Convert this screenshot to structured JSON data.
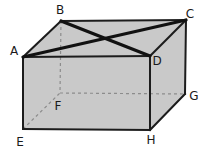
{
  "diagram": {
    "type": "cuboid-wireframe",
    "width": 208,
    "height": 157,
    "background": "#ffffff",
    "face_fill": "#c9c9c9",
    "edge_color": "#1c1c1c",
    "edge_width": 2,
    "hidden_edge_color": "#8c8c8c",
    "hidden_edge_width": 1.2,
    "hidden_edge_dash": "3,3",
    "diagonal_color": "#111111",
    "diagonal_width": 3.2,
    "label_color": "#1a1a1a",
    "label_font_size": 12,
    "vertices": [
      {
        "id": "A",
        "x": 23,
        "y": 57,
        "label": {
          "text": "A",
          "x": 14,
          "y": 55
        }
      },
      {
        "id": "B",
        "x": 61,
        "y": 21,
        "label": {
          "text": "B",
          "x": 60,
          "y": 14
        }
      },
      {
        "id": "C",
        "x": 186,
        "y": 20,
        "label": {
          "text": "C",
          "x": 190,
          "y": 18
        }
      },
      {
        "id": "D",
        "x": 150,
        "y": 56,
        "label": {
          "text": "D",
          "x": 157,
          "y": 65
        }
      },
      {
        "id": "E",
        "x": 23,
        "y": 129,
        "label": {
          "text": "E",
          "x": 20,
          "y": 146
        }
      },
      {
        "id": "F",
        "x": 60,
        "y": 93,
        "label": {
          "text": "F",
          "x": 58,
          "y": 110
        }
      },
      {
        "id": "G",
        "x": 185,
        "y": 94,
        "label": {
          "text": "G",
          "x": 194,
          "y": 100
        }
      },
      {
        "id": "H",
        "x": 150,
        "y": 130,
        "label": {
          "text": "H",
          "x": 151,
          "y": 144
        }
      }
    ],
    "faces": [
      {
        "name": "top-face",
        "points": [
          "A",
          "B",
          "C",
          "D"
        ]
      },
      {
        "name": "front-face",
        "points": [
          "A",
          "D",
          "H",
          "E"
        ]
      },
      {
        "name": "right-face",
        "points": [
          "D",
          "C",
          "G",
          "H"
        ]
      }
    ],
    "edges": [
      {
        "name": "edge-AB",
        "from": "A",
        "to": "B",
        "style": "solid"
      },
      {
        "name": "edge-BC",
        "from": "B",
        "to": "C",
        "style": "solid"
      },
      {
        "name": "edge-CD",
        "from": "C",
        "to": "D",
        "style": "solid"
      },
      {
        "name": "edge-AD",
        "from": "A",
        "to": "D",
        "style": "solid"
      },
      {
        "name": "edge-AE",
        "from": "A",
        "to": "E",
        "style": "solid"
      },
      {
        "name": "edge-DH",
        "from": "D",
        "to": "H",
        "style": "solid"
      },
      {
        "name": "edge-CG",
        "from": "C",
        "to": "G",
        "style": "solid"
      },
      {
        "name": "edge-EH",
        "from": "E",
        "to": "H",
        "style": "solid"
      },
      {
        "name": "edge-HG",
        "from": "H",
        "to": "G",
        "style": "solid"
      },
      {
        "name": "edge-BF",
        "from": "B",
        "to": "F",
        "style": "dashed"
      },
      {
        "name": "edge-EF",
        "from": "E",
        "to": "F",
        "style": "dashed"
      },
      {
        "name": "edge-FG",
        "from": "F",
        "to": "G",
        "style": "dashed"
      }
    ],
    "diagonals": [
      {
        "name": "diagonal-AC",
        "from": "A",
        "to": "C"
      },
      {
        "name": "diagonal-BD",
        "from": "B",
        "to": "D"
      }
    ]
  }
}
